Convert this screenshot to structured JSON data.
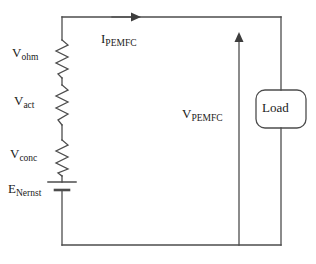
{
  "diagram": {
    "background_color": "#ffffff",
    "line_color": "#4d4d4d",
    "text_color": "#1a1a1a",
    "width": 316,
    "height": 264
  },
  "labels": {
    "v_ohm": {
      "base": "V",
      "sub": "ohm"
    },
    "v_act": {
      "base": "V",
      "sub": "act"
    },
    "v_conc": {
      "base": "V",
      "sub": "conc"
    },
    "e_nernst": {
      "base": "E",
      "sub": "Nernst"
    },
    "i_pemfc": {
      "base": "I",
      "sub": "PEMFC"
    },
    "v_pemfc": {
      "base": "V",
      "sub": "PEMFC"
    },
    "load": "Load"
  },
  "components": {
    "resistors": [
      {
        "name": "ohmic-resistor",
        "label_key": "v_ohm",
        "x": 62,
        "y_top": 40,
        "y_bottom": 78
      },
      {
        "name": "activation-resistor",
        "label_key": "v_act",
        "x": 62,
        "y_top": 85,
        "y_bottom": 125
      },
      {
        "name": "concentration-resistor",
        "label_key": "v_conc",
        "x": 62,
        "y_top": 140,
        "y_bottom": 176
      }
    ],
    "battery": {
      "name": "nernst-voltage-source",
      "label_key": "e_nernst",
      "x": 62,
      "y": 186
    },
    "load": {
      "name": "load-block",
      "x": 256,
      "y": 90,
      "width": 50,
      "height": 38
    },
    "current_arrow": {
      "name": "current-arrow",
      "direction": "right",
      "from_x": 62,
      "to_x": 141,
      "y": 17
    },
    "voltage_arrow": {
      "name": "voltage-arrow",
      "direction": "up",
      "x": 239,
      "from_y": 245,
      "to_y": 33
    }
  },
  "wires": {
    "left_x": 62,
    "right_x": 281,
    "top_y": 17,
    "bottom_y": 245
  }
}
